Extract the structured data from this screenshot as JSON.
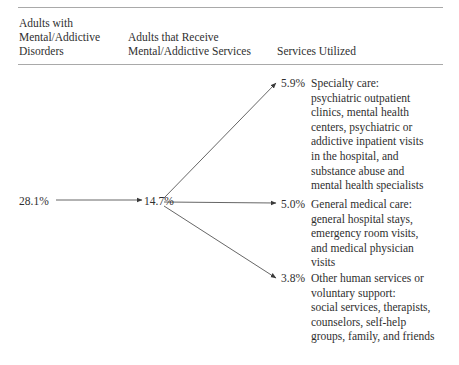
{
  "figure": {
    "columns": [
      {
        "id": "col1",
        "label": "Adults with\nMental/Addictive\nDisorders"
      },
      {
        "id": "col2",
        "label": "Adults that Receive\nMental/Addictive Services"
      },
      {
        "id": "col3",
        "label": "Services Utilized"
      }
    ],
    "flow": {
      "start_pct": "28.1%",
      "mid_pct": "14.7%"
    },
    "services": [
      {
        "id": "specialty-care",
        "pct": "5.9%",
        "title": "Specialty care:",
        "body": "Specialty care:\npsychiatric outpatient\nclinics, mental health\ncenters, psychiatric or\naddictive inpatient visits\nin the hospital, and\nsubstance abuse and\nmental health specialists"
      },
      {
        "id": "general-medical-care",
        "pct": "5.0%",
        "title": "General medical care:",
        "body": "General medical care:\ngeneral hospital stays,\nemergency room visits,\nand medical physician\nvisits"
      },
      {
        "id": "other-human-services",
        "pct": "3.8%",
        "title": "Other human services or voluntary support:",
        "body": "Other human services or\nvoluntary support:\nsocial services, therapists,\ncounselors, self-help\ngroups, family, and friends"
      }
    ],
    "colors": {
      "text": "#2f2f2f",
      "rule": "#a9a9a9",
      "connector": "#555555",
      "background": "#ffffff"
    }
  }
}
